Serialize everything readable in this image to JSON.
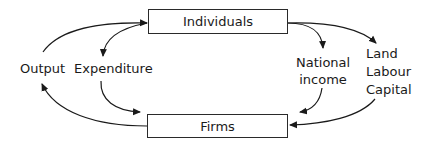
{
  "diagram": {
    "type": "circular-flow",
    "nodes": {
      "individuals": "Individuals",
      "firms": "Firms"
    },
    "labels": {
      "output": "Output",
      "expenditure": "Expenditure",
      "national_income_line1": "National",
      "national_income_line2": "income",
      "factor_land": "Land",
      "factor_labour": "Labour",
      "factor_capital": "Capital"
    },
    "flows": [
      {
        "from": "Firms",
        "via": "Output",
        "to": "Individuals"
      },
      {
        "from": "Individuals",
        "via": "Expenditure",
        "to": "Firms"
      },
      {
        "from": "Individuals",
        "via": "National income",
        "to": "Firms"
      },
      {
        "from": "Individuals",
        "via": "Land, Labour, Capital",
        "to": "Firms"
      }
    ],
    "colors": {
      "stroke": "#1a1a1a",
      "background": "#ffffff"
    }
  }
}
